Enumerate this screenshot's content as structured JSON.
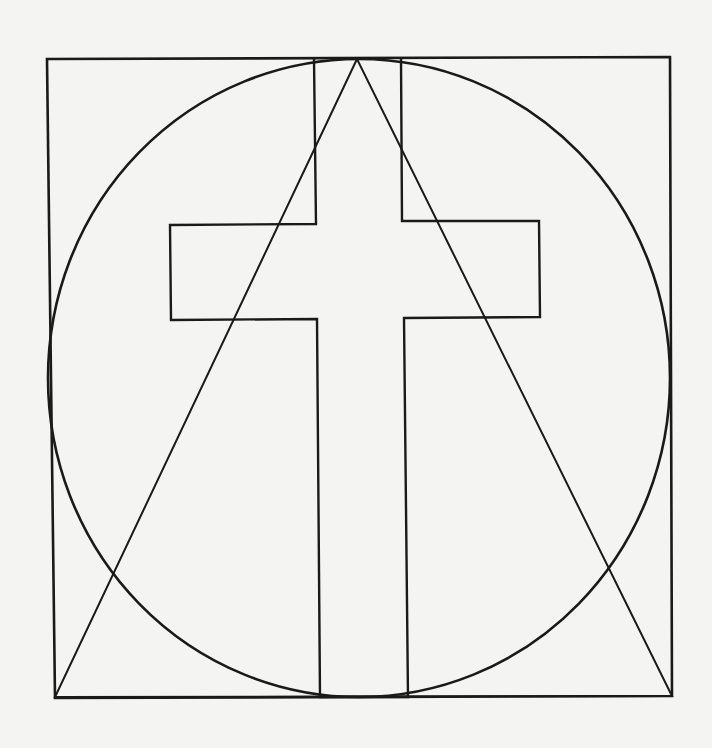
{
  "diagram": {
    "colors": {
      "background": "#f4f4f2",
      "stroke": "#1a1a1a"
    },
    "square": {
      "x1": 47,
      "y1": 59,
      "x2": 670,
      "y2": 697
    },
    "circle": {
      "cx": 359,
      "cy": 378,
      "rx": 311,
      "ry": 319
    },
    "cross": {
      "vertical": {
        "left_top": 314,
        "right_top": 402,
        "left_bottom": 320,
        "right_bottom": 408,
        "top": 59,
        "bottom": 697
      },
      "crossbar": {
        "left": 170,
        "right": 540,
        "top": 224,
        "bottom": 320
      }
    },
    "triangle": {
      "apex": [
        357,
        59
      ],
      "base_left": [
        55,
        697
      ],
      "base_right": [
        672,
        696
      ]
    }
  }
}
